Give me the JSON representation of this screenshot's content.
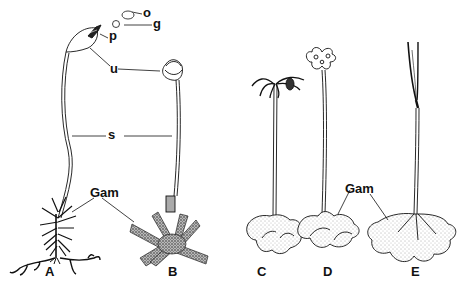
{
  "figure": {
    "type": "botanical-illustration",
    "structure_labels": {
      "o": "o",
      "g": "g",
      "p": "p",
      "u": "u",
      "s": "s",
      "gam_left": "Gam",
      "gam_right": "Gam"
    },
    "panels": [
      {
        "id": "A",
        "label": "A"
      },
      {
        "id": "B",
        "label": "B"
      },
      {
        "id": "C",
        "label": "C"
      },
      {
        "id": "D",
        "label": "D"
      },
      {
        "id": "E",
        "label": "E"
      }
    ],
    "colors": {
      "ink": "#111111",
      "background": "#ffffff",
      "stipple": "#555555"
    }
  }
}
